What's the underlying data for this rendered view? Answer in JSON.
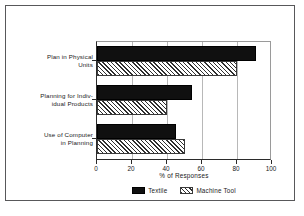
{
  "chart_data": {
    "type": "bar",
    "orientation": "horizontal",
    "title": "",
    "xlabel": "% of Responses",
    "ylabel": "",
    "xlim": [
      0,
      100
    ],
    "xticks": [
      0,
      20,
      40,
      60,
      80,
      100
    ],
    "xtick_labels": [
      "0",
      "20",
      "40",
      "60",
      "80",
      "100"
    ],
    "grid": true,
    "grid_axis": "x",
    "legend_position": "bottom-center",
    "categories": [
      "Plan in Physical Units",
      "Planning for Indiv- idual Products",
      "Use of Computer in Planning"
    ],
    "category_lines": [
      [
        "Plan in Physical",
        "Units"
      ],
      [
        "Planning for Indiv-",
        "idual Products"
      ],
      [
        "Use of Computer",
        "in Planning"
      ]
    ],
    "series": [
      {
        "name": "Textile",
        "fill": "solid-black",
        "color": "#101010",
        "values": [
          91,
          54,
          45
        ]
      },
      {
        "name": "Machine Tool",
        "fill": "diagonal-hatch",
        "color": "#2f2f2f",
        "values": [
          80,
          40,
          50
        ]
      }
    ]
  },
  "legend": {
    "items": [
      {
        "label": "Textile",
        "swatch": "solid-black-swatch"
      },
      {
        "label": "Machine Tool",
        "swatch": "hatched-swatch"
      }
    ]
  },
  "axis": {
    "x_title": "% of Responses",
    "tick_labels": [
      "0",
      "20",
      "40",
      "60",
      "80",
      "100"
    ]
  },
  "categories": {
    "c0_line1": "Plan in Physical",
    "c0_line2": "Units",
    "c1_line1": "Planning for Indiv-",
    "c1_line2": "idual Products",
    "c2_line1": "Use of Computer",
    "c2_line2": "in Planning"
  },
  "colors": {
    "frame": "#58585a",
    "axis": "#2b2b2b",
    "grid": "#b8b8b8",
    "bar_textile": "#101010",
    "bar_machine_hatch": "#2f2f2f",
    "background": "#ffffff"
  }
}
